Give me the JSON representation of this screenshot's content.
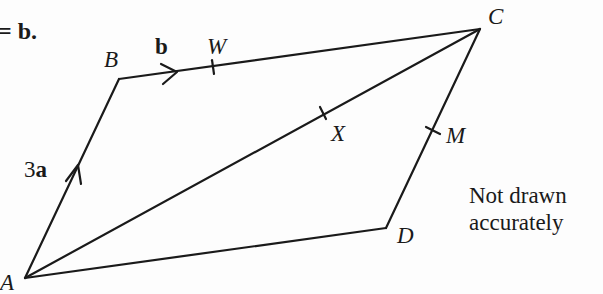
{
  "header_fragment": {
    "text": "= b."
  },
  "points": {
    "A": {
      "label": "A",
      "x": 25,
      "y": 278
    },
    "B": {
      "label": "B",
      "x": 119,
      "y": 79
    },
    "C": {
      "label": "C",
      "x": 480,
      "y": 29
    },
    "D": {
      "label": "D",
      "x": 386,
      "y": 228
    },
    "W": {
      "label": "W",
      "x": 213,
      "y": 67
    },
    "X": {
      "label": "X",
      "x": 323,
      "y": 113
    },
    "M": {
      "label": "M",
      "x": 433,
      "y": 130
    }
  },
  "vectors": {
    "AB": {
      "label": "3a",
      "coefficient": "3",
      "symbol": "a"
    },
    "BC": {
      "label": "b",
      "symbol": "b"
    }
  },
  "note": {
    "line1": "Not drawn",
    "line2": "accurately"
  },
  "colors": {
    "stroke": "#1a1a1a",
    "background": "#fdfdfd"
  }
}
